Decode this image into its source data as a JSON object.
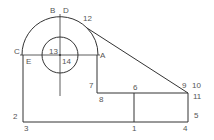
{
  "diagram": {
    "type": "engineering-drawing",
    "stroke_color": "#333333",
    "label_color": "#555555",
    "background": "#ffffff",
    "center": {
      "x": 60,
      "y": 55
    },
    "outer_radius": 38,
    "inner_radius": 18,
    "labels": {
      "A": "A",
      "B": "B",
      "C": "C",
      "D": "D",
      "E": "E",
      "n1": "1",
      "n2": "2",
      "n3": "3",
      "n4": "4",
      "n5": "5",
      "n6": "6",
      "n7": "7",
      "n8": "8",
      "n9": "9",
      "n10": "10",
      "n11": "11",
      "n12": "12",
      "n13": "13",
      "n14": "14"
    }
  }
}
